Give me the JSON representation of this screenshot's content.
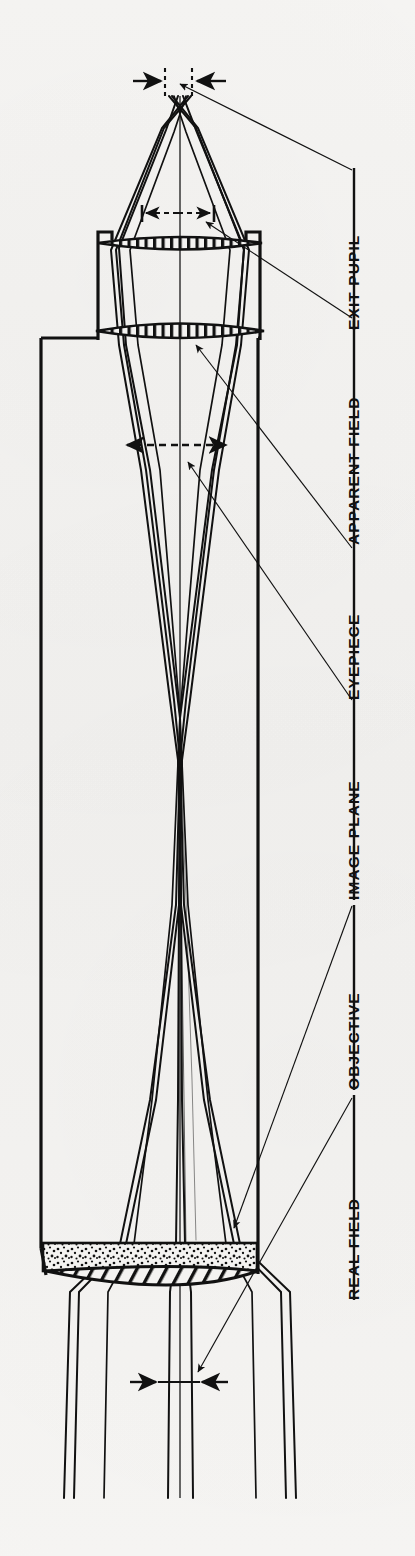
{
  "figure": {
    "kind": "optical-ray-diagram",
    "orientation": "rotated-90-labels",
    "background_color": "#f4f3f1",
    "ink_color": "#111111",
    "paper": "scanned-book-page"
  },
  "labels": [
    {
      "id": "exit-pupil",
      "text": "EXIT PUPIL",
      "x": 372,
      "y": 248,
      "bracket_y1": 168,
      "bracket_y2": 330,
      "leader_to_x": 176,
      "leader_to_y": 82
    },
    {
      "id": "apparent-field",
      "text": "APPARENT FIELD",
      "x": 372,
      "y": 420,
      "bracket_y1": 310,
      "bracket_y2": 545,
      "leader_to_x": 206,
      "leader_to_y": 286
    },
    {
      "id": "eyepiece",
      "text": "EYEPIECE",
      "x": 372,
      "y": 620,
      "bracket_y1": 545,
      "bracket_y2": 700,
      "leader_to_x": 196,
      "leader_to_y": 342
    },
    {
      "id": "image-plane",
      "text": "IMAGE PLANE",
      "x": 372,
      "y": 800,
      "bracket_y1": 700,
      "bracket_y2": 900,
      "leader_to_x": 186,
      "leader_to_y": 462
    },
    {
      "id": "objective",
      "text": "OBJECTIVE",
      "x": 372,
      "y": 1000,
      "bracket_y1": 905,
      "bracket_y2": 1090,
      "leader_to_x": 232,
      "leader_to_y": 1228
    },
    {
      "id": "real-field",
      "text": "REAL FIELD",
      "x": 372,
      "y": 1190,
      "bracket_y1": 1095,
      "bracket_y2": 1300,
      "leader_to_x": 196,
      "leader_to_y": 1378
    }
  ],
  "axis": {
    "x": 180,
    "y1": 96,
    "y2": 1498,
    "style": "thin-solid"
  },
  "tubes": {
    "main": {
      "left": 41,
      "right": 258,
      "top": 338,
      "bottom": 1246,
      "label": "objective-tube"
    },
    "eyepiece_barrel": {
      "left": 98,
      "right": 260,
      "top": 238,
      "bottom": 340,
      "label": "eyepiece-barrel"
    }
  },
  "elements": {
    "eye_lens": {
      "cy": 243,
      "half_width": 82,
      "thickness": 9,
      "hatch": "vertical-ticks",
      "label": "eye-lens"
    },
    "field_lens": {
      "cy": 330,
      "half_width": 84,
      "thickness": 10,
      "hatch": "vertical-ticks",
      "label": "field-lens"
    },
    "objective_stipple": {
      "top": 1243,
      "bottom": 1270,
      "left": 44,
      "right": 256,
      "fill": "stipple",
      "label": "objective-cell"
    },
    "objective_lens": {
      "cy": 1281,
      "half_width": 106,
      "thickness": 22,
      "hatch": "diagonal",
      "label": "objective-lens"
    }
  },
  "dimensions": [
    {
      "id": "exit-pupil-width",
      "y": 80,
      "x1": 165,
      "x2": 192,
      "style": "dotted-verticals-with-inward-arrows"
    },
    {
      "id": "eye-relief-span",
      "y": 213,
      "x1": 140,
      "x2": 215,
      "style": "dashed-double-arrow"
    },
    {
      "id": "apparent-field-span",
      "y": 445,
      "x1": 122,
      "x2": 230,
      "style": "dashed-double-arrow"
    },
    {
      "id": "real-field-span",
      "y": 1382,
      "x1": 158,
      "x2": 200,
      "style": "solid-inward-arrows"
    }
  ],
  "rays": {
    "count": 8,
    "description": "on-axis and off-axis bundles traced through objective, crossing at image plane, exiting through eyepiece to exit pupil"
  }
}
